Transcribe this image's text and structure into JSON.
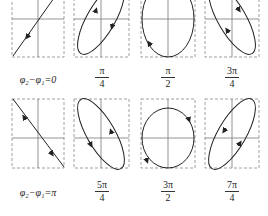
{
  "diagram": {
    "type": "lissajous-phase-difference-panels",
    "rows": [
      {
        "panels": [
          {
            "label": "φ₂−φ₁=0",
            "shape": "line",
            "slope": "positive",
            "arrows": "down-left"
          },
          {
            "label_num": "π",
            "label_den": "4",
            "shape": "ellipse",
            "tilt": "positive",
            "direction": "clockwise"
          },
          {
            "label_num": "π",
            "label_den": "2",
            "shape": "ellipse",
            "tilt": "none",
            "direction": "clockwise"
          },
          {
            "label_num": "3π",
            "label_den": "4",
            "shape": "ellipse",
            "tilt": "negative",
            "direction": "clockwise"
          }
        ]
      },
      {
        "panels": [
          {
            "label": "φ₂−φ₁=π",
            "shape": "line",
            "slope": "negative",
            "arrows": "both"
          },
          {
            "label_num": "5π",
            "label_den": "4",
            "shape": "ellipse",
            "tilt": "negative",
            "direction": "counterclockwise"
          },
          {
            "label_num": "3π",
            "label_den": "2",
            "shape": "ellipse",
            "tilt": "none",
            "direction": "counterclockwise"
          },
          {
            "label_num": "7π",
            "label_den": "4",
            "shape": "ellipse",
            "tilt": "positive",
            "direction": "counterclockwise"
          }
        ]
      }
    ],
    "colors": {
      "stroke": "#333333",
      "axis": "#555555",
      "frame": "#777777",
      "background": "#ffffff"
    }
  },
  "labels": {
    "p0": "φ₂−φ₁=0",
    "p1_num": "π",
    "p1_den": "4",
    "p2_num": "π",
    "p2_den": "2",
    "p3_num": "3π",
    "p3_den": "4",
    "p4": "φ₂−φ₁=π",
    "p5_num": "5π",
    "p5_den": "4",
    "p6_num": "3π",
    "p6_den": "2",
    "p7_num": "7π",
    "p7_den": "4"
  }
}
